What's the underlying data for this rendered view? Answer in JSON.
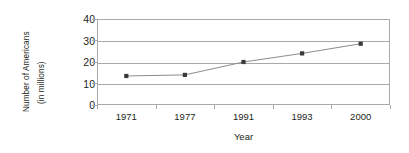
{
  "chart_data": {
    "type": "line",
    "title": "",
    "xlabel": "Year",
    "ylabel": "Number of Americans",
    "ylabel_sub": "(in millions)",
    "categories": [
      "1971",
      "1977",
      "1991",
      "1993",
      "2000"
    ],
    "values": [
      13.5,
      14,
      20,
      24,
      28.5
    ],
    "series": [
      {
        "name": "Number of Americans (in millions)",
        "values": [
          13.5,
          14,
          20,
          24,
          28.5
        ]
      }
    ],
    "ylim": [
      0,
      40
    ],
    "yticks": [
      0,
      10,
      20,
      30,
      40
    ],
    "ytick_labels": [
      "0",
      "10",
      "20",
      "30",
      "40"
    ],
    "xtick_labels": [
      "1971",
      "1977",
      "1991",
      "1993",
      "2000"
    ],
    "grid": true,
    "grid_axis": "y",
    "legend": false,
    "legend_position": "none",
    "marker": "square",
    "colors": {
      "line": "#8c8c8c",
      "marker": "#3a3a3a",
      "axis": "#a9a9a9",
      "text": "#231f20",
      "background": "#ffffff"
    }
  }
}
